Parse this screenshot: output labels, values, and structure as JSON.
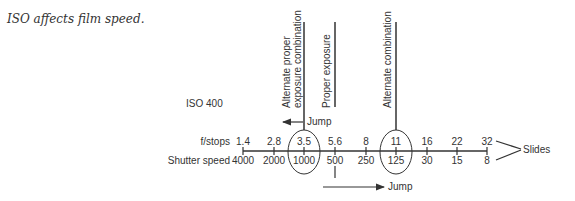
{
  "caption": "ISO affects film speed.",
  "diagram": {
    "iso_label": "ISO 400",
    "fstops_label": "f/stops",
    "shutter_label": "Shutter speed",
    "fstops": [
      "1.4",
      "2.8",
      "3.5",
      "5.6",
      "8",
      "11",
      "16",
      "22",
      "32"
    ],
    "shutter_speeds": [
      "4000",
      "2000",
      "1000",
      "500",
      "250",
      "125",
      "30",
      "15",
      "8"
    ],
    "callouts": {
      "alt_proper_line1": "Alternate proper",
      "alt_proper_line2": "exposure combination",
      "proper": "Proper exposure",
      "alternate": "Alternate combination"
    },
    "jump_top": "Jump",
    "jump_bottom": "Jump",
    "slides": "Slides"
  }
}
